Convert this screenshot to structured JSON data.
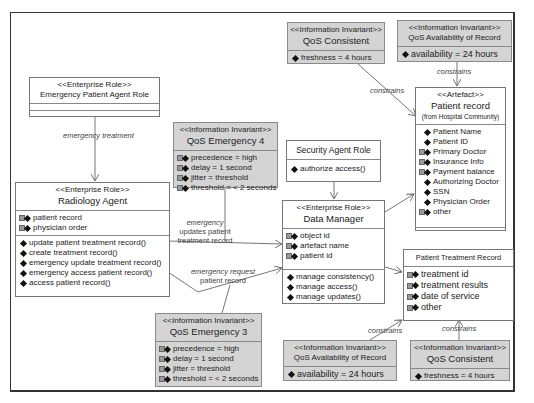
{
  "diagram": {
    "type": "UML class diagram",
    "boxes": {
      "emergency_patient_agent_role": {
        "stereotype": "<<Enterprise Role>>",
        "name": "Emergency Patient Agent  Role"
      },
      "radiology_agent": {
        "stereotype": "<<Enterprise Role>>",
        "name": "Radiology Agent",
        "attributes": [
          "patient record",
          "physician order"
        ],
        "operations": [
          "update patient treatment record()",
          "create treatment record()",
          "emergency update treatment record()",
          "emergency access patient record()",
          "access patient record()"
        ]
      },
      "qos_emergency_4": {
        "stereotype": "<<Information Invariant>>",
        "name": "QoS Emergency 4",
        "attributes": [
          "precedence = high",
          "delay = 1 second",
          "jitter = threshold",
          "threshold = < 2 seconds"
        ]
      },
      "qos_emergency_3": {
        "stereotype": "<<Information Invariant>>",
        "name": "QoS Emergency 3",
        "attributes": [
          "precedence = high",
          "delay = 1 second",
          "jitter = threshold",
          "threshold = < 2 seconds"
        ]
      },
      "security_agent_role": {
        "name": "Security Agent Role",
        "operations": [
          "authorize access()"
        ]
      },
      "data_manager": {
        "stereotype": "<<Enterprise Role>>",
        "name": "Data Manager",
        "attributes": [
          "object id",
          "artefact name",
          "patient id"
        ],
        "operations": [
          "manage consistency()",
          "manage access()",
          "manage updates()"
        ]
      },
      "qos_consistent_top": {
        "stereotype": "<<Information Invariant>>",
        "name": "QoS Consistent",
        "attributes": [
          "freshness = 4 hours"
        ]
      },
      "qos_availability_top": {
        "stereotype": "<<Information Invariant>>",
        "name": "QoS Availability of Record",
        "attributes": [
          "availability = 24 hours"
        ]
      },
      "patient_record": {
        "stereotype": "<<Artefact>>",
        "name": "Patient record",
        "subtitle": "(from Hospital Community)",
        "attributes": [
          "Patient Name",
          "Patient ID",
          "Primary Doctor",
          "Insurance Info",
          "Payment balance",
          "Authorizing Doctor",
          "SSN",
          "Physician Order",
          "other"
        ]
      },
      "patient_treatment_record": {
        "name": "Patient Treatment Record",
        "attributes": [
          "treatment id",
          "treatment results",
          "date of service",
          "other"
        ]
      },
      "qos_availability_bottom": {
        "stereotype": "<<Information Invariant>>",
        "name": "QoS Availability of Record",
        "attributes": [
          "availability = 24 hours"
        ]
      },
      "qos_consistent_bottom": {
        "stereotype": "<<Information Invariant>>",
        "name": "QoS Consistent",
        "attributes": [
          "freshness = 4 hours"
        ]
      }
    },
    "edge_labels": {
      "emergency_treatment": "emergency treatment",
      "emergency_updates_1": "emergency",
      "emergency_updates_2": "updates patient",
      "emergency_updates_3": "treatment record",
      "emergency_request_1": "emergency request",
      "emergency_request_2": "patient record",
      "constrains_top_left": "constrains",
      "constrains_top_right": "constrains",
      "constrains_bottom_left": "constrains",
      "constrains_bottom_right": "constrains"
    }
  }
}
